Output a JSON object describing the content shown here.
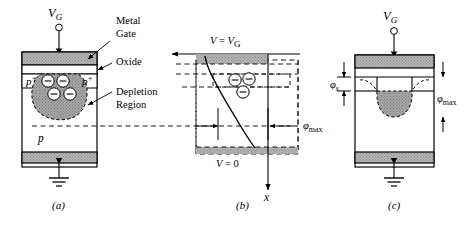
{
  "figure": {
    "type": "semiconductor-device-diagram",
    "panels": [
      {
        "id": "a",
        "letter": "(a)",
        "caption_letter": "a",
        "terminal_label": "V",
        "terminal_subscript": "G",
        "annotations": [
          {
            "name": "metal-gate",
            "line1": "Metal",
            "line2": "Gate"
          },
          {
            "name": "oxide",
            "line1": "Oxide",
            "line2": ""
          },
          {
            "name": "depletion-region",
            "line1": "Depletion",
            "line2": "Region"
          }
        ],
        "region_labels": [
          {
            "name": "p-plus-left",
            "text": "p",
            "sup": "+"
          },
          {
            "name": "p-plus-right",
            "text": "p",
            "sup": "+"
          },
          {
            "name": "p-substrate",
            "text": "p",
            "sup": ""
          }
        ],
        "electron_count": 4,
        "electron_glyph": "−",
        "ground": true
      },
      {
        "id": "b",
        "letter": "(b)",
        "caption_letter": "b",
        "top_label_v": "V",
        "top_label_eq": " = ",
        "top_label_vg": "V",
        "top_label_vg_sub": "G",
        "bottom_label_v": "V",
        "bottom_label_eq": " = 0",
        "axis_label": "x",
        "phi_max_symbol": "φ",
        "phi_max_sub": "max",
        "electron_count": 3,
        "electron_glyph": "−"
      },
      {
        "id": "c",
        "letter": "(c)",
        "caption_letter": "c",
        "terminal_label": "V",
        "terminal_subscript": "G",
        "phi_s_symbol": "φ",
        "phi_s_sub": "s",
        "phi_max_symbol": "φ",
        "phi_max_sub": "max",
        "ground": true
      }
    ],
    "colors": {
      "stroke": "#000000",
      "metal_fill": "#a9a9a9",
      "depletion_fill": "#b0b0b0",
      "background": "#ffffff",
      "dashed": "#000000"
    }
  }
}
